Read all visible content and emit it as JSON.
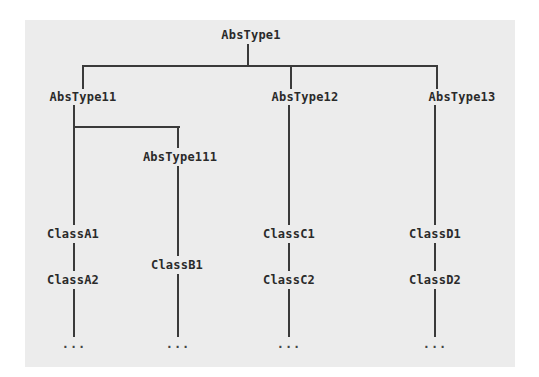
{
  "diagram": {
    "root": "AbsType1",
    "level1": [
      "AbsType11",
      "AbsType12",
      "AbsType13"
    ],
    "level2": [
      "AbsType111"
    ],
    "classes": {
      "a1": "ClassA1",
      "a2": "ClassA2",
      "b1": "ClassB1",
      "c1": "ClassC1",
      "c2": "ClassC2",
      "d1": "ClassD1",
      "d2": "ClassD2"
    },
    "ellipsis": "..."
  },
  "colors": {
    "background": "#ececec",
    "line": "#3a3a3a",
    "text": "#2a2a2a"
  }
}
